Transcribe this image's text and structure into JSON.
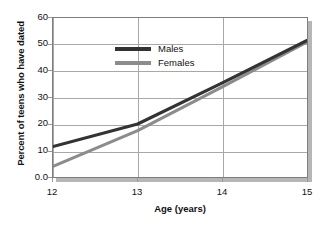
{
  "chart_data": {
    "type": "line",
    "title": "",
    "subtitle": "",
    "xlabel": "Age (years)",
    "ylabel": "Percent of teens who have dated",
    "x": [
      12,
      13,
      14,
      15
    ],
    "xlim": [
      12,
      15
    ],
    "ylim": [
      0,
      60
    ],
    "xticks": [
      "12",
      "13",
      "14",
      "15"
    ],
    "yticks": [
      "0.0",
      "10",
      "20",
      "30",
      "40",
      "50",
      "60"
    ],
    "ytick_values": [
      0,
      10,
      20,
      30,
      40,
      50,
      60
    ],
    "grid": "both",
    "legend_position": "top-left",
    "series": [
      {
        "name": "Males",
        "color": "#333333",
        "values": [
          11.5,
          20.0,
          35.5,
          51.5
        ]
      },
      {
        "name": "Females",
        "color": "#8c8c8c",
        "values": [
          4.0,
          17.5,
          34.0,
          51.0
        ]
      }
    ]
  },
  "axes": {
    "y_title": "Percent of teens who have dated",
    "x_title": "Age (years)",
    "y_labels": [
      "60",
      "50",
      "40",
      "30",
      "20",
      "10",
      "0.0"
    ],
    "x_labels": [
      "12",
      "13",
      "14",
      "15"
    ]
  },
  "legend": {
    "entries": [
      {
        "label": "Males",
        "color": "#333333"
      },
      {
        "label": "Females",
        "color": "#8c8c8c"
      }
    ]
  },
  "colors": {
    "males": "#333333",
    "females": "#8c8c8c",
    "grid": "#a8a8a8",
    "frame": "#7d7d7d",
    "shadow": "#b6b6b6",
    "background": "#ffffff"
  }
}
